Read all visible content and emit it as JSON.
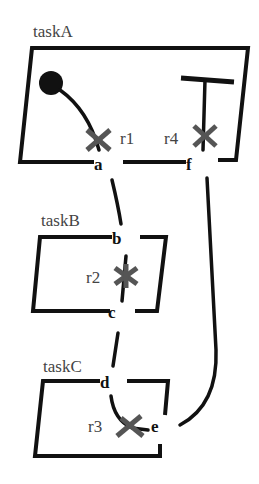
{
  "diagram": {
    "tasks": [
      {
        "id": "taskA",
        "label": "taskA"
      },
      {
        "id": "taskB",
        "label": "taskB"
      },
      {
        "id": "taskC",
        "label": "taskC"
      }
    ],
    "ports": {
      "a": "a",
      "b": "b",
      "c": "c",
      "d": "d",
      "e": "e",
      "f": "f"
    },
    "resources": {
      "r1": "r1",
      "r2": "r2",
      "r3": "r3",
      "r4": "r4"
    },
    "start_symbol": "filled-circle",
    "end_symbol": "t-bar",
    "colors": {
      "stroke": "#111111",
      "cross": "#555555",
      "label": "#444444",
      "background": "#ffffff"
    }
  }
}
